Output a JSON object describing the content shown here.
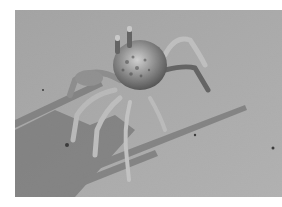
{
  "image": {
    "subject": "ghost crab on sand",
    "style": "grayscale photograph",
    "colors": {
      "background": "#ffffff",
      "sand": "#a9a9a9",
      "sand_light": "#b8b8b8",
      "shadow": "#6e6e6e",
      "crab_body": "#8c8c8c",
      "crab_dark": "#3a3a3a",
      "crab_light": "#d4d4d4"
    }
  }
}
